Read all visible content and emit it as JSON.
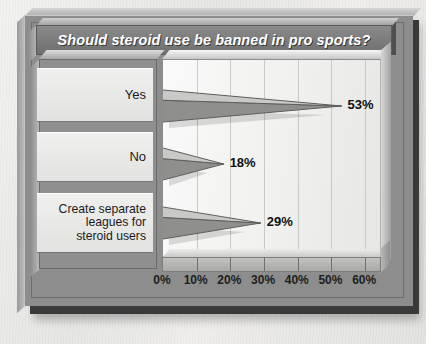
{
  "chart_data": {
    "type": "bar",
    "orientation": "horizontal",
    "title": "Should steroid use be banned in pro sports?",
    "categories": [
      "Yes",
      "No",
      "Create separate leagues for steroid users"
    ],
    "category_lines": [
      [
        "Yes"
      ],
      [
        "No"
      ],
      [
        "Create separate",
        "leagues for",
        "steroid users"
      ]
    ],
    "values": [
      53,
      18,
      29
    ],
    "value_labels": [
      "53%",
      "18%",
      "29%"
    ],
    "xlabel": "",
    "ylabel": "",
    "xlim": [
      0,
      65
    ],
    "xticks": [
      0,
      10,
      20,
      30,
      40,
      50,
      60
    ],
    "xtick_labels": [
      "0%",
      "10%",
      "20%",
      "30%",
      "40%",
      "50%",
      "60%"
    ],
    "grid": "vertical",
    "legend": "none",
    "style": "3d-cone-bars",
    "colors": {
      "bar_top_face": "#c9c9c7",
      "bar_bottom_face": "#8f8f8d",
      "plot_background": "#f4f4f2",
      "gridline": "#c9c9c7",
      "title_bar": "#7c7c7c",
      "title_text": "#ffffff",
      "label_panel": "#e9e9e7",
      "frame": "#8d8d8d",
      "frame_edge": "#3a3a3a"
    }
  }
}
